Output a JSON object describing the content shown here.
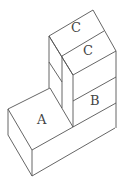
{
  "diagram": {
    "type": "isometric block arrangement",
    "stroke_color": "#555555",
    "labels": {
      "a": "A",
      "b": "B",
      "c_top": "C",
      "c_lower": "C"
    }
  }
}
